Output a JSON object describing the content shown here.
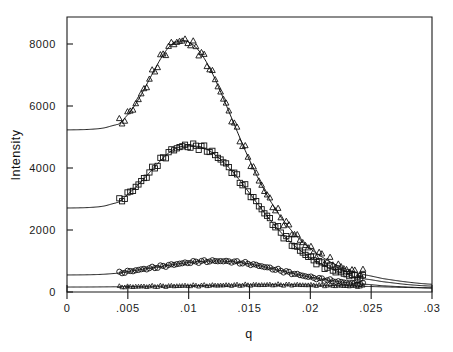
{
  "chart_data": {
    "type": "line",
    "title": "",
    "xlabel": "q",
    "ylabel": "Intensity",
    "xlim": [
      0,
      0.03
    ],
    "ylim": [
      0,
      8800
    ],
    "grid": false,
    "legend": "none",
    "xticks": [
      0,
      0.005,
      0.01,
      0.015,
      0.02,
      0.025,
      0.03
    ],
    "xticklabels": [
      "0",
      ".005",
      ".01",
      ".015",
      ".02",
      ".025",
      ".03"
    ],
    "yticks": [
      0,
      2000,
      4000,
      6000,
      8000
    ],
    "yticklabels": [
      "0",
      "2000",
      "4000",
      "6000",
      "8000"
    ],
    "series": [
      {
        "name": "curve-1",
        "marker": "triangle-up-open",
        "baseline": 5230,
        "peak_x": 0.0097,
        "peak_y": 8100,
        "data_x_start": 0.0043,
        "data_x_end": 0.0245,
        "x": [
          0.0,
          0.001,
          0.002,
          0.003,
          0.004,
          0.0043,
          0.005,
          0.0055,
          0.006,
          0.0065,
          0.007,
          0.0075,
          0.008,
          0.0085,
          0.009,
          0.0095,
          0.0097,
          0.01,
          0.0105,
          0.011,
          0.0115,
          0.012,
          0.0125,
          0.013,
          0.0135,
          0.014,
          0.0145,
          0.015,
          0.0155,
          0.016,
          0.0165,
          0.017,
          0.0175,
          0.018,
          0.0185,
          0.019,
          0.0195,
          0.02,
          0.0205,
          0.021,
          0.0215,
          0.022,
          0.0225,
          0.023,
          0.0235,
          0.024,
          0.0245,
          0.026,
          0.028,
          0.03
        ],
        "y": [
          5230,
          5235,
          5250,
          5290,
          5390,
          5440,
          5720,
          5980,
          6300,
          6660,
          7030,
          7390,
          7710,
          7950,
          8070,
          8100,
          8100,
          8060,
          7930,
          7700,
          7390,
          7010,
          6570,
          6110,
          5640,
          5170,
          4700,
          4260,
          3840,
          3450,
          3080,
          2760,
          2460,
          2200,
          1960,
          1750,
          1560,
          1400,
          1250,
          1120,
          1000,
          900,
          810,
          730,
          660,
          600,
          550,
          430,
          320,
          250
        ]
      },
      {
        "name": "curve-2",
        "marker": "square-open",
        "baseline": 2710,
        "peak_x": 0.0108,
        "peak_y": 4700,
        "data_x_start": 0.0043,
        "data_x_end": 0.0245,
        "x": [
          0.0,
          0.001,
          0.002,
          0.003,
          0.004,
          0.0043,
          0.005,
          0.0055,
          0.006,
          0.0065,
          0.007,
          0.0075,
          0.008,
          0.0085,
          0.009,
          0.0095,
          0.01,
          0.0105,
          0.0108,
          0.0112,
          0.0118,
          0.0125,
          0.013,
          0.0135,
          0.014,
          0.0145,
          0.015,
          0.0155,
          0.016,
          0.0165,
          0.017,
          0.0175,
          0.018,
          0.0185,
          0.019,
          0.0195,
          0.02,
          0.0205,
          0.021,
          0.0215,
          0.022,
          0.0225,
          0.023,
          0.0235,
          0.024,
          0.0245,
          0.026,
          0.028,
          0.03
        ],
        "y": [
          2710,
          2715,
          2730,
          2770,
          2870,
          2920,
          3150,
          3330,
          3520,
          3730,
          3950,
          4160,
          4360,
          4530,
          4640,
          4700,
          4710,
          4700,
          4695,
          4650,
          4530,
          4320,
          4140,
          3930,
          3700,
          3450,
          3190,
          2930,
          2670,
          2420,
          2180,
          1960,
          1750,
          1560,
          1390,
          1240,
          1100,
          980,
          880,
          780,
          700,
          630,
          570,
          510,
          460,
          420,
          330,
          240,
          190
        ]
      },
      {
        "name": "curve-3",
        "marker": "circle-open",
        "baseline": 550,
        "peak_x": 0.0122,
        "peak_y": 1000,
        "data_x_start": 0.0043,
        "data_x_end": 0.0245,
        "x": [
          0.0,
          0.001,
          0.002,
          0.003,
          0.004,
          0.0043,
          0.005,
          0.006,
          0.007,
          0.008,
          0.009,
          0.01,
          0.011,
          0.0118,
          0.0122,
          0.0128,
          0.0135,
          0.0142,
          0.015,
          0.016,
          0.017,
          0.018,
          0.019,
          0.02,
          0.021,
          0.022,
          0.023,
          0.024,
          0.0245,
          0.026,
          0.028,
          0.03
        ],
        "y": [
          550,
          552,
          558,
          572,
          600,
          615,
          660,
          720,
          780,
          840,
          900,
          950,
          985,
          998,
          1000,
          995,
          980,
          950,
          905,
          830,
          740,
          650,
          560,
          480,
          410,
          350,
          300,
          265,
          250,
          200,
          160,
          130
        ]
      },
      {
        "name": "curve-4",
        "marker": "triangle-up-filled",
        "baseline": 160,
        "peak_x": 0.017,
        "peak_y": 235,
        "data_x_start": 0.0043,
        "data_x_end": 0.0245,
        "x": [
          0.0,
          0.002,
          0.004,
          0.0043,
          0.006,
          0.008,
          0.01,
          0.012,
          0.014,
          0.0155,
          0.017,
          0.0185,
          0.02,
          0.0215,
          0.023,
          0.0245,
          0.026,
          0.028,
          0.03
        ],
        "y": [
          160,
          162,
          168,
          170,
          180,
          192,
          205,
          215,
          225,
          231,
          235,
          233,
          226,
          214,
          198,
          182,
          165,
          145,
          130
        ]
      }
    ]
  },
  "axes": {
    "x_label": "q",
    "y_label": "Intensity"
  }
}
